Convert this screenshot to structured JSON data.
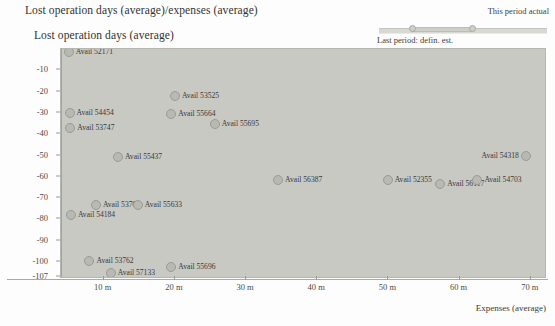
{
  "chart_title": "Lost operation days (average)/expenses (average)",
  "y_axis_title": "Lost operation days (average)",
  "x_axis_title": "Expenses (average)",
  "slider": {
    "top_label": "This period actual",
    "bottom_label": "Last period: defin. est."
  },
  "colors": {
    "plot_background": "#c9c9c4",
    "marker_fill": "#b9b9b4",
    "marker_stroke": "#9b9b96",
    "page_background": "#fdfdfd",
    "text": "#33322f"
  },
  "chart_data": {
    "type": "scatter",
    "title": "Lost operation days (average)/expenses (average)",
    "xlabel": "Expenses (average)",
    "ylabel": "Lost operation days (average)",
    "xlim": [
      4,
      72
    ],
    "ylim": [
      -107,
      0
    ],
    "grid": false,
    "legend": "none",
    "x_ticks": [
      {
        "value": 10,
        "label": "10 m"
      },
      {
        "value": 20,
        "label": "20 m"
      },
      {
        "value": 30,
        "label": "30 m"
      },
      {
        "value": 40,
        "label": "40 m"
      },
      {
        "value": 50,
        "label": "50 m"
      },
      {
        "value": 60,
        "label": "60 m"
      },
      {
        "value": 70,
        "label": "70 m"
      }
    ],
    "y_ticks": [
      {
        "value": -10,
        "label": "-10"
      },
      {
        "value": -20,
        "label": "-20"
      },
      {
        "value": -30,
        "label": "-30"
      },
      {
        "value": -40,
        "label": "-40"
      },
      {
        "value": -50,
        "label": "-50"
      },
      {
        "value": -60,
        "label": "-60"
      },
      {
        "value": -70,
        "label": "-70"
      },
      {
        "value": -80,
        "label": "-80"
      },
      {
        "value": -90,
        "label": "-90"
      },
      {
        "value": -100,
        "label": "-100"
      },
      {
        "value": -107,
        "label": "-107"
      }
    ],
    "points": [
      {
        "label": "Avail 52171",
        "x": 5.1,
        "y": -1.5,
        "label_side": "right"
      },
      {
        "label": "Avail 53525",
        "x": 20.0,
        "y": -22.0,
        "label_side": "right"
      },
      {
        "label": "Avail 54454",
        "x": 5.2,
        "y": -30.0,
        "label_side": "right"
      },
      {
        "label": "Avail 55664",
        "x": 19.5,
        "y": -30.5,
        "label_side": "right"
      },
      {
        "label": "Avail 53747",
        "x": 5.3,
        "y": -37.0,
        "label_side": "right"
      },
      {
        "label": "Avail 55695",
        "x": 25.6,
        "y": -35.0,
        "label_side": "right"
      },
      {
        "label": "Avail 55437",
        "x": 12.0,
        "y": -50.5,
        "label_side": "right"
      },
      {
        "label": "Avail 54318",
        "x": 69.3,
        "y": -50.0,
        "label_side": "left"
      },
      {
        "label": "Avail 56387",
        "x": 34.5,
        "y": -61.5,
        "label_side": "right"
      },
      {
        "label": "Avail 52355",
        "x": 49.9,
        "y": -61.5,
        "label_side": "right"
      },
      {
        "label": "Avail 56117",
        "x": 57.3,
        "y": -63.5,
        "label_side": "right"
      },
      {
        "label": "Avail 54703",
        "x": 62.5,
        "y": -61.5,
        "label_side": "right"
      },
      {
        "label": "Avail 53703",
        "x": 8.9,
        "y": -73.0,
        "label_side": "right"
      },
      {
        "label": "Avail 55633",
        "x": 14.8,
        "y": -73.0,
        "label_side": "right"
      },
      {
        "label": "Avail 54184",
        "x": 5.4,
        "y": -78.0,
        "label_side": "right"
      },
      {
        "label": "Avail 53762",
        "x": 8.0,
        "y": -99.5,
        "label_side": "right"
      },
      {
        "label": "Avail 57133",
        "x": 11.0,
        "y": -105.0,
        "label_side": "right"
      },
      {
        "label": "Avail 55696",
        "x": 19.5,
        "y": -102.5,
        "label_side": "right"
      }
    ]
  }
}
